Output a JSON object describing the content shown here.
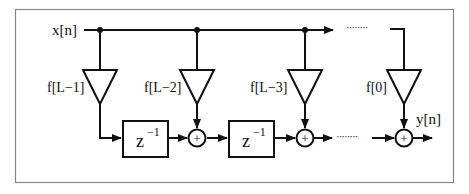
{
  "diagram": {
    "input_label": "x[n]",
    "output_label": "y[n]",
    "taps": [
      {
        "label": "f[L−1]"
      },
      {
        "label": "f[L−2]"
      },
      {
        "label": "f[L−3]"
      },
      {
        "label": "f[0]"
      }
    ],
    "delay_blocks": [
      {
        "base": "z",
        "exponent": "−1"
      },
      {
        "base": "z",
        "exponent": "−1"
      }
    ],
    "adder_symbol": "+",
    "ellipsis": "········",
    "colors": {
      "line": "#111111",
      "frame": "#888888",
      "background": "#ffffff"
    }
  }
}
